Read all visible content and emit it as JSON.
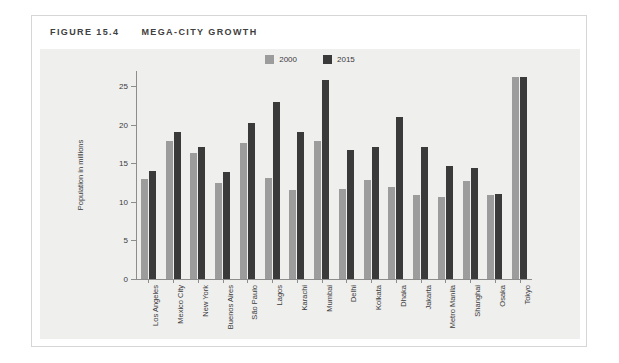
{
  "figure": {
    "number": "FIGURE 15.4",
    "title": "MEGA-CITY GROWTH"
  },
  "legend": {
    "position": "top-center",
    "entries": [
      {
        "label": "2000",
        "color": "#9c9c9c"
      },
      {
        "label": "2015",
        "color": "#3a3a3a"
      }
    ]
  },
  "colors": {
    "panel_background": "#efefee",
    "card_background": "#ffffff",
    "border": "#d6d6d6",
    "axis": "#8d8d8d",
    "text": "#3b3b3b",
    "series_2000": "#9c9c9c",
    "series_2015": "#3a3a3a"
  },
  "chart_data": {
    "type": "bar",
    "title": "MEGA-CITY GROWTH",
    "xlabel": "",
    "ylabel": "Population in millions",
    "ylim": [
      0,
      27
    ],
    "yticks": [
      0,
      5,
      10,
      15,
      20,
      25
    ],
    "grid": false,
    "legend_position": "top-center",
    "categories": [
      "Los Angeles",
      "Mexico City",
      "New York",
      "Buenos Aires",
      "São Paulo",
      "Lagos",
      "Karachi",
      "Mumbai",
      "Delhi",
      "Kolkata",
      "Dhaka",
      "Jakarta",
      "Metro Manila",
      "Shanghai",
      "Osaka",
      "Tokyo"
    ],
    "series": [
      {
        "name": "2000",
        "color": "#9c9c9c",
        "values": [
          13.0,
          17.9,
          16.3,
          12.4,
          17.6,
          13.1,
          11.6,
          17.9,
          11.7,
          12.8,
          12.0,
          10.9,
          10.6,
          12.7,
          10.9,
          26.2
        ]
      },
      {
        "name": "2015",
        "color": "#3a3a3a",
        "values": [
          14.0,
          19.1,
          17.2,
          13.9,
          20.2,
          23.0,
          19.1,
          25.8,
          16.7,
          17.2,
          21.0,
          17.2,
          14.7,
          14.4,
          11.1,
          26.2
        ]
      }
    ]
  }
}
